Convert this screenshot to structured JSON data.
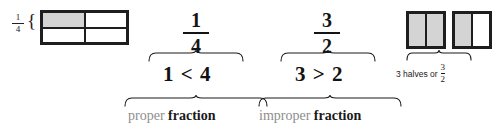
{
  "diagram": {
    "colors": {
      "shade": "#d4d4d4",
      "outline": "#1e1e1e",
      "soft_text": "#8d8d8d",
      "strong_text": "#1a1a1a"
    },
    "left_model": {
      "label_fraction": {
        "numerator": "1",
        "denominator": "4"
      },
      "brace": "{",
      "rows": 2,
      "cols": 2,
      "shaded_cells": 1,
      "total_cells": 4
    },
    "columns": [
      {
        "fraction": {
          "numerator": "1",
          "denominator": "4"
        },
        "comparison": "1 < 4",
        "caption_soft": "proper",
        "caption_strong": "fraction"
      },
      {
        "fraction": {
          "numerator": "3",
          "denominator": "2"
        },
        "comparison": "3 > 2",
        "caption_soft": "improper",
        "caption_strong": "fraction"
      }
    ],
    "right_model": {
      "bars": [
        {
          "cells": 2,
          "shaded": 2
        },
        {
          "cells": 2,
          "shaded": 1
        }
      ],
      "caption_text": "3 halves or",
      "caption_fraction": {
        "numerator": "3",
        "denominator": "2"
      }
    }
  }
}
